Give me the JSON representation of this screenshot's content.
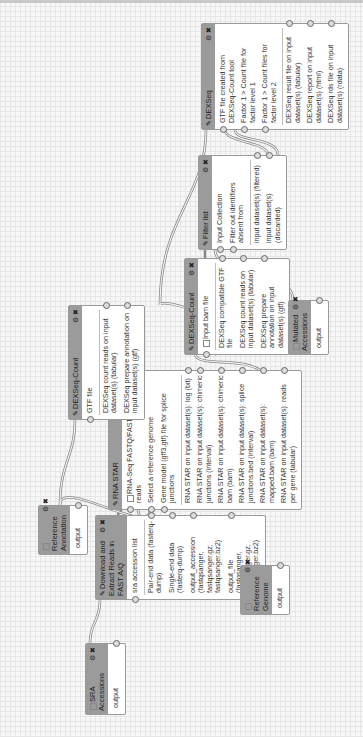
{
  "canvas": {
    "rotation": "90deg clockwise",
    "grid_color": "#e6e6e6",
    "node_header_color": "#9b9b9b"
  },
  "nodes": {
    "sra_accessions": {
      "title": "SRA Accessions",
      "type": "input",
      "outputs": [
        "output"
      ]
    },
    "reference_annotation": {
      "title": "Reference Annotation",
      "type": "input",
      "outputs": [
        "output"
      ]
    },
    "reference_genome": {
      "title": "Reference Genome",
      "type": "input",
      "outputs": [
        "output"
      ]
    },
    "mutated_accessions": {
      "title": "Mutated Accessions",
      "type": "input",
      "outputs": [
        "output"
      ]
    },
    "download_extract": {
      "title": "Download and Extract Reads in FAST A/Q",
      "inputs": [
        "sra accession list"
      ],
      "outputs": [
        "Pair-end data (fasterq-dump)",
        "Single-end data (fasterq-dump)",
        "output_accession (fastqsanger, fastqsanger.gz, fastqsanger.bz2)",
        "output_file (fastqsanger, fastqsanger.gz, fastqsanger.bz2)"
      ]
    },
    "rna_star": {
      "title": "RNA STAR",
      "inputs": [
        "RNA-Seq FASTQ/FASTA paired reads",
        "Select a reference genome",
        "Gene model (gff3,gtf) file for splice junctions"
      ],
      "outputs": [
        "RNA STAR on input dataset(s): log (txt)",
        "RNA STAR on input dataset(s): chimeric junctions (interval)",
        "RNA STAR on input dataset(s): chimeric bam (bam)",
        "RNA STAR on input dataset(s): splice junctions.bed (interval)",
        "RNA STAR on input dataset(s): mapped.bam (bam)",
        "RNA STAR on input dataset(s): reads per gene (tabular)"
      ]
    },
    "dexseq_count_left": {
      "title": "DEXSeq-Count",
      "inputs": [
        "GTF file"
      ],
      "outputs": [
        "DEXSeq count reads on input dataset(s) (tabular)",
        "DEXSeq prepare annotation on input dataset(s) (gtf)"
      ]
    },
    "dexseq_count_right": {
      "title": "DEXSeq-Count",
      "inputs": [
        "Input bam file"
      ],
      "outputs": [
        "DEXSeq compatible GTF file",
        "DEXSeq count reads on input dataset(s) (tabular)",
        "DEXSeq prepare annotation on input dataset(s) (gtf)"
      ]
    },
    "filter_list": {
      "title": "Filter list",
      "inputs": [
        "Input Collection",
        "Filter out identifiers absent from"
      ],
      "outputs": [
        "input dataset(s) (filtered)",
        "input dataset(s) (discarded)"
      ]
    },
    "dexseq": {
      "title": "DEXSeq",
      "inputs": [
        "GTF file created from DEXSeq-Count tool",
        "Factor 1 > Count file for factor level 1",
        "Factor 1 > Count files for factor level 2"
      ],
      "outputs": [
        "DEXSeq result file on input dataset(s) (tabular)",
        "DEXSeq report on input dataset(s) (html)",
        "DEXSeq rds file on input dataset(s) (rdata)"
      ]
    }
  },
  "icons": {
    "edit": "wrench-icon",
    "settings": "gear-icon",
    "close": "close-icon",
    "input": "checkbox-icon"
  }
}
